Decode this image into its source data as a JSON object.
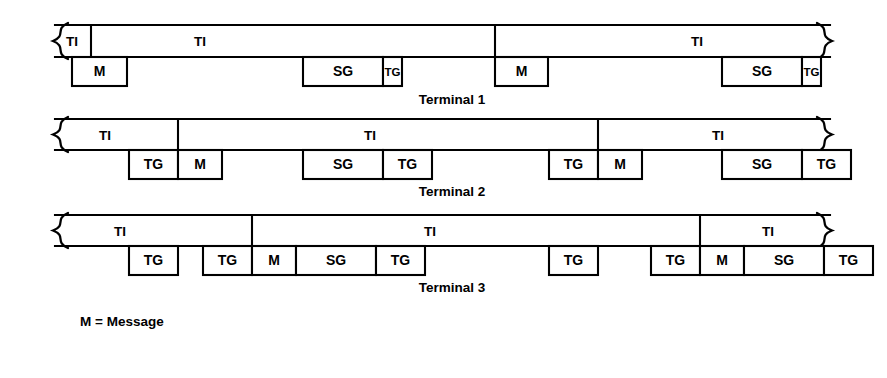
{
  "figure": {
    "stroke_color": "#000000",
    "fill_color": "#ffffff",
    "background": "#ffffff",
    "width": 887,
    "height": 378
  },
  "legend": {
    "entries": [
      {
        "symbol": "M",
        "separator": "=",
        "text": "Message",
        "full": "M =  Message"
      }
    ]
  },
  "terminals": [
    {
      "id": "terminal-1",
      "label": "Terminal 1",
      "label_x": 452,
      "label_y": 100,
      "frame_top_y": 25,
      "frame_mid_y": 57,
      "slot_bottom_y": 86,
      "frame_left_x": 55,
      "frame_right_x": 830,
      "ti_intervals": [
        {
          "label": "TI",
          "x_start": 55,
          "x_end": 91,
          "center_x": 72,
          "center_y": 41
        },
        {
          "label": "TI",
          "x_start": 91,
          "x_end": 495,
          "center_x": 200,
          "center_y": 41
        },
        {
          "label": "TI",
          "x_start": 495,
          "x_end": 830,
          "center_x": 697,
          "center_y": 41
        }
      ],
      "slots": [
        {
          "label": "M",
          "x": 72,
          "width": 55,
          "narrow": false
        },
        {
          "label": "SG",
          "x": 303,
          "width": 80,
          "narrow": false
        },
        {
          "label": "TG",
          "x": 383,
          "width": 19,
          "narrow": true
        },
        {
          "label": "M",
          "x": 495,
          "width": 53,
          "narrow": false
        },
        {
          "label": "SG",
          "x": 722,
          "width": 80,
          "narrow": false
        },
        {
          "label": "TG",
          "x": 802,
          "width": 19,
          "narrow": true
        }
      ]
    },
    {
      "id": "terminal-2",
      "label": "Terminal 2",
      "label_x": 452,
      "label_y": 192,
      "frame_top_y": 119,
      "frame_mid_y": 150,
      "slot_bottom_y": 179,
      "frame_left_x": 55,
      "frame_right_x": 830,
      "ti_intervals": [
        {
          "label": "TI",
          "x_start": 55,
          "x_end": 178,
          "center_x": 105,
          "center_y": 135
        },
        {
          "label": "TI",
          "x_start": 178,
          "x_end": 598,
          "center_x": 370,
          "center_y": 135
        },
        {
          "label": "TI",
          "x_start": 598,
          "x_end": 830,
          "center_x": 718,
          "center_y": 135
        }
      ],
      "slots": [
        {
          "label": "TG",
          "x": 129,
          "width": 49,
          "narrow": false
        },
        {
          "label": "M",
          "x": 178,
          "width": 44,
          "narrow": false
        },
        {
          "label": "SG",
          "x": 303,
          "width": 80,
          "narrow": false
        },
        {
          "label": "TG",
          "x": 383,
          "width": 49,
          "narrow": false
        },
        {
          "label": "TG",
          "x": 549,
          "width": 49,
          "narrow": false
        },
        {
          "label": "M",
          "x": 598,
          "width": 44,
          "narrow": false
        },
        {
          "label": "SG",
          "x": 722,
          "width": 80,
          "narrow": false
        },
        {
          "label": "TG",
          "x": 802,
          "width": 49,
          "narrow": false
        }
      ]
    },
    {
      "id": "terminal-3",
      "label": "Terminal 3",
      "label_x": 452,
      "label_y": 288,
      "frame_top_y": 215,
      "frame_mid_y": 246,
      "slot_bottom_y": 275,
      "frame_left_x": 55,
      "frame_right_x": 830,
      "ti_intervals": [
        {
          "label": "TI",
          "x_start": 55,
          "x_end": 252,
          "center_x": 120,
          "center_y": 231
        },
        {
          "label": "TI",
          "x_start": 252,
          "x_end": 700,
          "center_x": 430,
          "center_y": 231
        },
        {
          "label": "TI",
          "x_start": 700,
          "x_end": 830,
          "center_x": 768,
          "center_y": 231
        }
      ],
      "slots": [
        {
          "label": "TG",
          "x": 129,
          "width": 49,
          "narrow": false
        },
        {
          "label": "TG",
          "x": 203,
          "width": 49,
          "narrow": false
        },
        {
          "label": "M",
          "x": 252,
          "width": 44,
          "narrow": false
        },
        {
          "label": "SG",
          "x": 296,
          "width": 80,
          "narrow": false
        },
        {
          "label": "TG",
          "x": 376,
          "width": 49,
          "narrow": false
        },
        {
          "label": "TG",
          "x": 549,
          "width": 49,
          "narrow": false
        },
        {
          "label": "TG",
          "x": 651,
          "width": 49,
          "narrow": false
        },
        {
          "label": "M",
          "x": 700,
          "width": 44,
          "narrow": false
        },
        {
          "label": "SG",
          "x": 744,
          "width": 80,
          "narrow": false
        },
        {
          "label": "TG",
          "x": 824,
          "width": 49,
          "narrow": false
        }
      ]
    }
  ]
}
